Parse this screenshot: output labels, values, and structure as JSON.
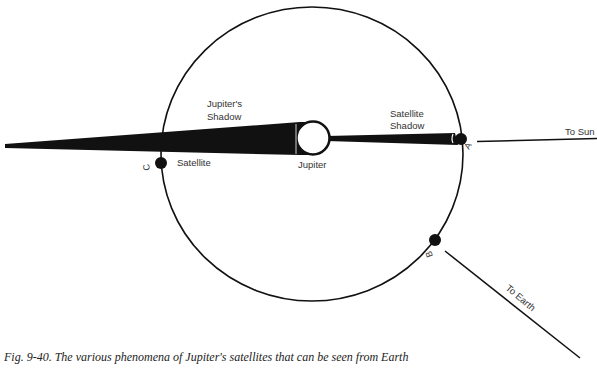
{
  "figure": {
    "caption": "Fig. 9-40. The various phenomena of Jupiter's satellites that can be seen from Earth"
  },
  "labels": {
    "jupiters_shadow_line1": "Jupiter's",
    "jupiters_shadow_line2": "Shadow",
    "satellite_shadow_line1": "Satellite",
    "satellite_shadow_line2": "Shadow",
    "jupiter": "Jupiter",
    "satellite": "Satellite",
    "to_sun": "To Sun",
    "to_earth": "To Earth"
  },
  "points": {
    "a": "A",
    "b": "B",
    "c": "C"
  },
  "colors": {
    "ink": "#111111",
    "text": "#333333",
    "background": "#ffffff"
  }
}
